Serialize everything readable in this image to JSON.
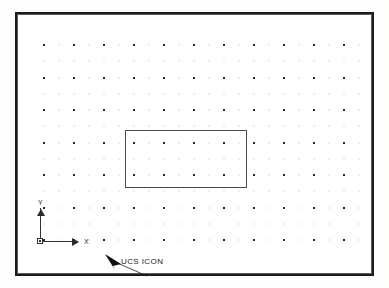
{
  "app": {
    "type": "cad-drawing-area",
    "title": "AutoCAD drawing window"
  },
  "drawing": {
    "background_color": "#ffffff",
    "frame_color": "#1b1b1b",
    "frame": {
      "x": 15,
      "y": 12,
      "width": 359,
      "height": 264
    }
  },
  "grid": {
    "name": "grid-dots",
    "visible": true,
    "dot_color": "#2a2a2a",
    "faint_dot_color": "#b9b9b9",
    "origin": {
      "x": 44,
      "y": 45
    },
    "spacing_x": 30,
    "spacing_y": 32.5,
    "columns": 12,
    "rows": 7,
    "minor_subdivisions": 2
  },
  "entities": {
    "rectangle": {
      "name": "rectangle-entity",
      "label": "rectangle",
      "stroke_color": "#4a4a4a",
      "x": 125,
      "y": 130,
      "width": 122,
      "height": 58
    }
  },
  "ucs": {
    "name": "ucs-icon",
    "origin": {
      "x": 40,
      "y": 241
    },
    "axis_length_x": 38,
    "axis_length_y": 33,
    "stroke_color": "#303030",
    "x_axis_label": "X",
    "y_axis_label": "Y"
  },
  "callout": {
    "label": "UCS ICON",
    "leader_color": "#1c1c1c",
    "text_position": {
      "x": 121,
      "y": 257
    },
    "arrow_tip": {
      "x": 88,
      "y": 240
    }
  }
}
